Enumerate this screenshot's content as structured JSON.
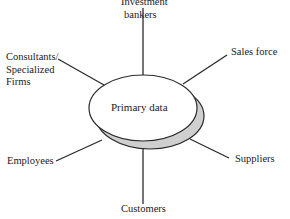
{
  "diagram": {
    "center": {
      "label": "Primary data"
    },
    "sources": [
      {
        "id": "investment-bankers",
        "lines": [
          "Investment",
          "bankers"
        ]
      },
      {
        "id": "sales-force",
        "lines": [
          "Sales force"
        ]
      },
      {
        "id": "consultants",
        "lines": [
          "Consultants/",
          "Specialized",
          "Firms"
        ]
      },
      {
        "id": "employees",
        "lines": [
          "Employees"
        ]
      },
      {
        "id": "suppliers",
        "lines": [
          "Suppliers"
        ]
      },
      {
        "id": "customers",
        "lines": [
          "Customers"
        ]
      }
    ],
    "colors": {
      "stroke": "#2a2a2a",
      "ellipse_fill": "#ffffff",
      "shadow_fill": "#cfcfcf",
      "text": "#222222"
    }
  }
}
